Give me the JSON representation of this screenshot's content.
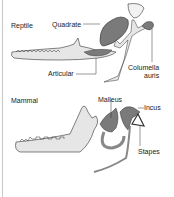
{
  "figure": {
    "panels": [
      {
        "name": "Reptile",
        "labels": {
          "quadrate": "Quadrate",
          "articular": "Articular",
          "columella_line1": "Columella",
          "columella_line2": "auris"
        }
      },
      {
        "name": "Mammal",
        "labels": {
          "malleus": "Malleus",
          "incus": "Incus",
          "stapes": "Stapes"
        }
      }
    ],
    "colors": {
      "bone_fill": "#e6e6e6",
      "dark_bone": "#7a7a7a",
      "outline": "#333333",
      "border": "#c8c8c8"
    }
  }
}
